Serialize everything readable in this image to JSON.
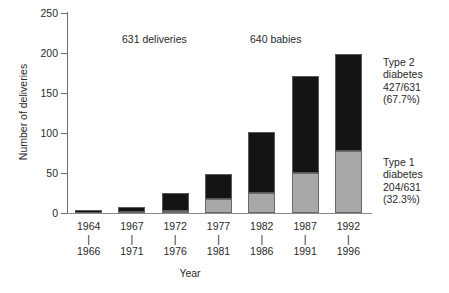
{
  "chart_data": {
    "type": "bar",
    "stacked": true,
    "title": "",
    "xlabel": "Year",
    "ylabel": "Number of deliveries",
    "ylim": [
      0,
      250
    ],
    "yticks": [
      0,
      50,
      100,
      150,
      200,
      250
    ],
    "grid": false,
    "legend_position": "right-annotations",
    "categories": [
      "1964\n|\n1966",
      "1967\n|\n1971",
      "1972\n|\n1976",
      "1977\n|\n1981",
      "1982\n|\n1986",
      "1987\n|\n1991",
      "1992\n|\n1996"
    ],
    "category_parts": [
      {
        "start": "1964",
        "dash": "|",
        "end": "1966"
      },
      {
        "start": "1967",
        "dash": "|",
        "end": "1971"
      },
      {
        "start": "1972",
        "dash": "|",
        "end": "1976"
      },
      {
        "start": "1977",
        "dash": "|",
        "end": "1981"
      },
      {
        "start": "1982",
        "dash": "|",
        "end": "1986"
      },
      {
        "start": "1987",
        "dash": "|",
        "end": "1991"
      },
      {
        "start": "1992",
        "dash": "|",
        "end": "1996"
      }
    ],
    "series": [
      {
        "name": "Type 1 diabetes",
        "color": "#a8a8a8",
        "values": [
          0,
          1,
          3,
          18,
          25,
          50,
          77
        ]
      },
      {
        "name": "Type 2 diabetes",
        "color": "#141414",
        "values": [
          4,
          6,
          22,
          31,
          76,
          121,
          122
        ]
      }
    ],
    "totals": [
      4,
      7,
      25,
      49,
      101,
      171,
      199
    ],
    "annotations": [
      {
        "id": "deliveries-note",
        "text": "631 deliveries",
        "x": 122,
        "y": 33
      },
      {
        "id": "babies-note",
        "text": "640 babies",
        "x": 250,
        "y": 33
      }
    ],
    "side_labels": [
      {
        "id": "type-2-label",
        "top": 56,
        "lines": [
          "Type 2",
          "diabetes",
          "427/631",
          "(67.7%)"
        ]
      },
      {
        "id": "type-1-label",
        "top": 156,
        "lines": [
          "Type 1",
          "diabetes",
          "204/631",
          "(32.3%)"
        ]
      }
    ]
  }
}
